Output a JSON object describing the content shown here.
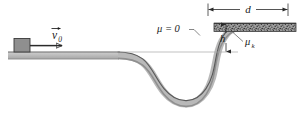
{
  "figure": {
    "kind": "physics-diagram",
    "labels": {
      "initial_velocity": "v",
      "initial_velocity_subscript": "0",
      "frictionless_label": "μ = 0",
      "kinetic_friction_label": "μ",
      "kinetic_friction_subscript": "k",
      "distance_label": "d",
      "height_label": "h"
    },
    "colors": {
      "track_fill": "#b8b8b8",
      "track_outline": "#4a4a4a",
      "block_fill": "#8c8c8c",
      "block_outline": "#3c3c3c",
      "rough_surface": "#6e6e6e",
      "reference_line": "#9a9a9a",
      "dimension_line": "#2a2a2a",
      "leader_line": "#555555",
      "text": "#1a1a1a",
      "background": "#ffffff"
    },
    "geometry": {
      "left_platform_top_y": 52,
      "right_platform_top_y": 24,
      "valley_bottom_y": 104,
      "dimension_d_left_x": 208,
      "dimension_d_right_x": 288,
      "dimension_d_y": 9,
      "height_h_x": 226,
      "height_h_top_y": 24,
      "height_h_bottom_y": 52,
      "reference_line_y": 52
    }
  }
}
